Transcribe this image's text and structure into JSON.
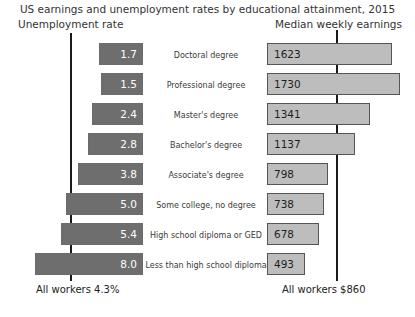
{
  "chart_data": {
    "type": "bar",
    "title": "US earnings and unemployment rates by educational attainment, 2015",
    "subtype": "back-to-back horizontal bar (tornado)",
    "categories": [
      "Doctoral degree",
      "Professional degree",
      "Master's degree",
      "Bachelor's degree",
      "Associate's degree",
      "Some college, no degree",
      "High school diploma or GED",
      "Less than high school diploma"
    ],
    "series": [
      {
        "name": "Unemployment rate",
        "side": "left",
        "unit": "percent",
        "values": [
          1.7,
          1.5,
          2.4,
          2.8,
          3.8,
          5.0,
          5.4,
          8.0
        ],
        "labels": [
          "1.7",
          "1.5",
          "2.4",
          "2.8",
          "3.8",
          "5.0",
          "5.4",
          "8.0"
        ],
        "color": "#6e6e6e",
        "label_color": "#ffffff",
        "reference_line": {
          "value": 4.3,
          "label": "All workers 4.3%"
        },
        "axis_direction": "right-to-left"
      },
      {
        "name": "Median weekly earnings",
        "side": "right",
        "unit": "US dollars",
        "values": [
          1623,
          1730,
          1341,
          1137,
          798,
          738,
          678,
          493
        ],
        "labels": [
          "1623",
          "1730",
          "1341",
          "1137",
          "798",
          "738",
          "678",
          "493"
        ],
        "color": "#bdbdbd",
        "label_color": "#1e1e1e",
        "reference_line": {
          "value": 860,
          "label": "All workers $860"
        },
        "axis_direction": "left-to-right"
      }
    ],
    "headers": {
      "left": "Unemployment rate",
      "right": "Median weekly earnings"
    },
    "grid": false,
    "legend": "none",
    "xlabel": "",
    "ylabel": ""
  }
}
